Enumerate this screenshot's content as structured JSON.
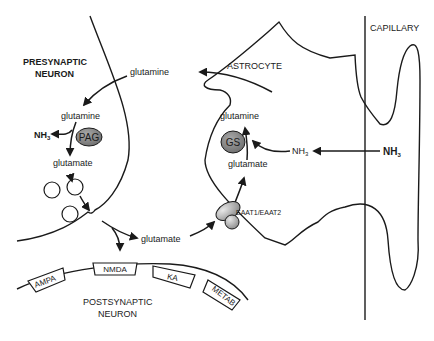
{
  "diagram": {
    "type": "glutamate-glutamine cycle",
    "regions": {
      "presynaptic": "PRESYNAPTIC",
      "presynaptic2": "NEURON",
      "astrocyte": "ASTROCYTE",
      "capillary": "CAPILLARY",
      "postsynaptic": "POSTSYNAPTIC",
      "postsynaptic2": "NEURON"
    },
    "molecules": {
      "gln_transfer": "glutamine",
      "gln_pre": "glutamine",
      "glu_pre": "glutamate",
      "nh3_pre": "NH",
      "nh3_pre_sub": "3",
      "gln_astro": "glutamine",
      "glu_astro": "glutamate",
      "nh3_astro": "NH",
      "nh3_astro_sub": "3",
      "nh3_cap": "NH",
      "nh3_cap_sub": "3",
      "glu_cleft": "glutamate"
    },
    "enzymes": {
      "pag": "PAG",
      "gs": "GS",
      "transporter": "EAAT1/EAAT2"
    },
    "receptors": [
      "AMPA",
      "NMDA",
      "KA",
      "METAB"
    ],
    "colors": {
      "line": "#1a1a1a",
      "enzyme_fill": "#8a8a8a",
      "transporter_fill": "#b5b5b5"
    }
  }
}
